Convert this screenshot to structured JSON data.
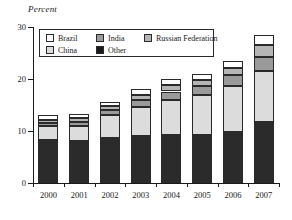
{
  "chart_data": {
    "type": "bar",
    "stacked": true,
    "title": "",
    "subtitle": "",
    "xlabel": "",
    "ylabel": "Percent",
    "ylim": [
      0,
      30
    ],
    "yticks": [
      0,
      10,
      20,
      30
    ],
    "grid": false,
    "legend_position": "top-left-inside",
    "categories": [
      "2000",
      "2001",
      "2002",
      "2003",
      "2004",
      "2005",
      "2006",
      "2007"
    ],
    "series": [
      {
        "name": "Other",
        "color": "#2b2b2b",
        "values": [
          8.3,
          8.0,
          8.6,
          9.0,
          9.2,
          9.3,
          9.9,
          11.7
        ]
      },
      {
        "name": "China",
        "color": "#dcdcdc",
        "values": [
          2.6,
          3.0,
          4.4,
          5.6,
          6.8,
          7.6,
          8.8,
          9.9
        ]
      },
      {
        "name": "India",
        "color": "#9a9a9a",
        "values": [
          0.7,
          0.8,
          1.0,
          1.4,
          1.6,
          1.7,
          2.0,
          2.6
        ]
      },
      {
        "name": "Russian Federation",
        "color": "#b5b5b5",
        "values": [
          0.6,
          0.7,
          0.8,
          1.0,
          1.2,
          1.3,
          1.5,
          2.4
        ]
      },
      {
        "name": "Brazil",
        "color": "#ffffff",
        "values": [
          0.8,
          0.7,
          0.7,
          1.0,
          1.2,
          1.1,
          1.3,
          1.9
        ]
      }
    ],
    "totals": [
      13.0,
      13.2,
      15.5,
      18.0,
      20.0,
      21.0,
      23.5,
      28.5
    ],
    "legend_entries": [
      {
        "label": "Brazil",
        "color": "#ffffff"
      },
      {
        "label": "India",
        "color": "#9a9a9a"
      },
      {
        "label": "Russian Federation",
        "color": "#b5b5b5"
      },
      {
        "label": "China",
        "color": "#dcdcdc"
      },
      {
        "label": "Other",
        "color": "#1a1a1a"
      }
    ]
  }
}
